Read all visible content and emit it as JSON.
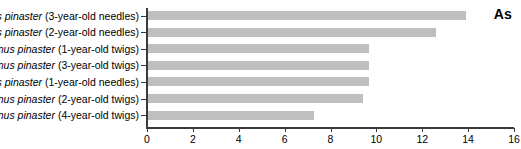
{
  "chart_data": {
    "type": "bar",
    "orientation": "horizontal",
    "title": "",
    "annotation": "As",
    "xlabel": "",
    "ylabel": "",
    "xlim": [
      0,
      16
    ],
    "xticks": [
      0,
      2,
      4,
      6,
      8,
      10,
      12,
      14,
      16
    ],
    "xtick_labels": [
      "0",
      "2",
      "4",
      "6",
      "8",
      "10",
      "12",
      "14",
      "16"
    ],
    "grid": false,
    "legend": false,
    "bar_color": "#bfbfbf",
    "axis_color": "#3a3a3a",
    "categories": [
      "Pinus pinaster (3-year-old needles)",
      "Pinus pinaster (2-year-old needles)",
      "Pinus pinaster (1-year-old twigs)",
      "Pinus pinaster (3-year-old twigs)",
      "Pinus pinaster (1-year-old needles)",
      "Pinus pinaster (2-year-old twigs)",
      "Pinus pinaster (4-year-old twigs)"
    ],
    "category_parts": [
      {
        "species": "Pinus pinaster",
        "detail": " (3-year-old needles)"
      },
      {
        "species": "Pinus pinaster",
        "detail": " (2-year-old needles)"
      },
      {
        "species": "Pinus pinaster",
        "detail": " (1-year-old twigs)"
      },
      {
        "species": "Pinus pinaster",
        "detail": " (3-year-old twigs)"
      },
      {
        "species": "Pinus pinaster",
        "detail": " (1-year-old needles)"
      },
      {
        "species": "Pinus pinaster",
        "detail": " (2-year-old twigs)"
      },
      {
        "species": "Pinus pinaster",
        "detail": " (4-year-old twigs)"
      }
    ],
    "values": [
      13.9,
      12.6,
      9.7,
      9.7,
      9.7,
      9.4,
      7.3
    ]
  }
}
